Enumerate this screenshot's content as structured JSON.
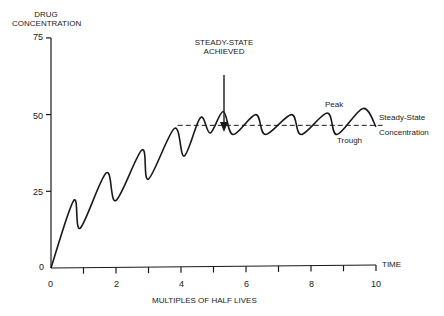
{
  "chart_data": {
    "type": "line",
    "title": "",
    "ylabel": "DRUG CONCENTRATION",
    "xlabel": "MULTIPLES OF HALF LIVES",
    "x_axis_end_label": "TIME",
    "xlim": [
      0,
      10
    ],
    "ylim": [
      0,
      75
    ],
    "x_ticks": [
      0,
      2,
      4,
      6,
      8,
      10
    ],
    "x_minor_ticks": [
      1,
      3,
      5,
      7,
      9
    ],
    "y_ticks": [
      0,
      25,
      50,
      75
    ],
    "grid": false,
    "series": [
      {
        "name": "Drug concentration",
        "style": "solid",
        "x": [
          0,
          0.7,
          0.9,
          1.7,
          2.0,
          2.8,
          3.0,
          3.8,
          4.1,
          4.6,
          4.9,
          5.3,
          5.6,
          6.3,
          6.6,
          7.4,
          7.7,
          8.5,
          8.8,
          9.6,
          10.0
        ],
        "y": [
          0,
          22,
          13,
          31,
          22,
          38.5,
          29,
          45.5,
          36.5,
          49,
          44,
          51,
          43.5,
          50,
          43.5,
          50,
          43.5,
          50.5,
          43.5,
          52,
          46
        ]
      },
      {
        "name": "Steady-State Concentration",
        "style": "dashed",
        "x": [
          3.9,
          10.2
        ],
        "y": [
          46.5,
          46.5
        ]
      }
    ],
    "annotations": [
      {
        "text": "STEADY-STATE ACHIEVED",
        "x": 5.3,
        "y": 51,
        "arrow": true
      },
      {
        "text": "Peak",
        "x": 8.5,
        "y": 50.5
      },
      {
        "text": "Trough",
        "x": 8.8,
        "y": 43.5
      },
      {
        "text": "Steady-State Concentration",
        "x": 10.2,
        "y": 46.5
      }
    ]
  },
  "labels": {
    "y_title_line1": "DRUG",
    "y_title_line2": "CONCENTRATION",
    "x_title": "MULTIPLES OF HALF LIVES",
    "time": "TIME",
    "steady_line1": "STEADY-STATE",
    "steady_line2": "ACHIEVED",
    "peak": "Peak",
    "trough": "Trough",
    "ss_line1": "Steady-State",
    "ss_line2": "Concentration",
    "y75": "75",
    "y50": "50",
    "y25": "25",
    "y0": "0",
    "x0": "0",
    "x2": "2",
    "x4": "4",
    "x6": "6",
    "x8": "8",
    "x10": "10"
  }
}
